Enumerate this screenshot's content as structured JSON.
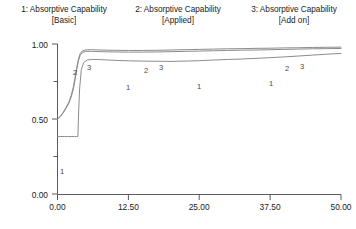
{
  "legend": {
    "entries": [
      {
        "title": "1: Absorptive Capability",
        "subtitle": "[Basic]"
      },
      {
        "title": "2: Absorptive Capability",
        "subtitle": "[Applied]"
      },
      {
        "title": "3: Absorptive Capability",
        "subtitle": "[Add on]"
      }
    ]
  },
  "axes": {
    "y_labels": [
      "1.00",
      "0.50",
      "0.00"
    ],
    "x_labels": [
      "0.00",
      "12.50",
      "25.00",
      "37.50",
      "50.00"
    ]
  },
  "curve_tags": {
    "tag_1a": "1",
    "tag_1b": "1",
    "tag_1c": "1",
    "tag_1d": "1",
    "tag_2a": "2",
    "tag_2b": "2",
    "tag_2c": "2",
    "tag_3a": "3",
    "tag_3b": "3",
    "tag_3c": "3"
  },
  "chart_data": {
    "type": "line",
    "title": "",
    "subtitle": "",
    "xlabel": "",
    "ylabel": "",
    "xlim": [
      0.0,
      50.0
    ],
    "ylim": [
      0.0,
      1.0
    ],
    "xticks": [
      0.0,
      12.5,
      25.0,
      37.5,
      50.0
    ],
    "xtick_labels": [
      "0.00",
      "12.50",
      "25.00",
      "37.50",
      "50.00"
    ],
    "yticks": [
      0.0,
      0.25,
      0.5,
      0.75,
      1.0
    ],
    "ytick_labels": [
      "0.00",
      "",
      "0.50",
      "",
      "1.00"
    ],
    "ytick_labeled": [
      0.0,
      0.5,
      1.0
    ],
    "grid": false,
    "legend_position": "top",
    "line_color": "#8c8c8c",
    "axis_color": "#5a5a5a",
    "series": [
      {
        "name": "1: Absorptive Capability [Basic]",
        "label": "1",
        "x": [
          0.0,
          0.6,
          1.2,
          1.8,
          2.4,
          3.0,
          3.4,
          3.6,
          3.7,
          3.9,
          4.2,
          4.6,
          5.2,
          6.0,
          7.0,
          8.5,
          10.0,
          12.5,
          15.0,
          17.5,
          20.0,
          22.5,
          25.0,
          27.5,
          30.0,
          32.5,
          35.0,
          37.5,
          40.0,
          42.5,
          45.0,
          47.5,
          50.0
        ],
        "y": [
          0.383,
          0.383,
          0.383,
          0.383,
          0.383,
          0.383,
          0.383,
          0.383,
          0.52,
          0.7,
          0.83,
          0.875,
          0.893,
          0.897,
          0.897,
          0.894,
          0.891,
          0.888,
          0.886,
          0.885,
          0.884,
          0.886,
          0.889,
          0.893,
          0.897,
          0.9,
          0.904,
          0.909,
          0.914,
          0.92,
          0.926,
          0.932,
          0.937
        ]
      },
      {
        "name": "2: Absorptive Capability [Applied]",
        "label": "2",
        "x": [
          0.0,
          0.5,
          1.0,
          1.5,
          2.0,
          2.4,
          2.8,
          3.1,
          3.4,
          3.7,
          4.0,
          4.4,
          5.0,
          6.0,
          7.5,
          10.0,
          12.5,
          15.0,
          17.5,
          20.0,
          22.5,
          25.0,
          27.5,
          30.0,
          32.5,
          35.0,
          37.5,
          40.0,
          42.5,
          45.0,
          47.5,
          50.0
        ],
        "y": [
          0.5,
          0.516,
          0.54,
          0.57,
          0.605,
          0.645,
          0.7,
          0.762,
          0.83,
          0.888,
          0.925,
          0.944,
          0.951,
          0.951,
          0.949,
          0.947,
          0.946,
          0.946,
          0.947,
          0.949,
          0.951,
          0.953,
          0.955,
          0.957,
          0.959,
          0.96,
          0.962,
          0.964,
          0.966,
          0.968,
          0.969,
          0.97
        ]
      },
      {
        "name": "3: Absorptive Capability [Add on]",
        "label": "3",
        "x": [
          0.0,
          0.5,
          1.0,
          1.5,
          2.0,
          2.4,
          2.8,
          3.1,
          3.4,
          3.7,
          4.0,
          4.4,
          5.0,
          6.0,
          7.5,
          10.0,
          12.5,
          15.0,
          17.5,
          20.0,
          22.5,
          25.0,
          27.5,
          30.0,
          32.5,
          35.0,
          37.5,
          40.0,
          42.5,
          45.0,
          47.5,
          50.0
        ],
        "y": [
          0.5,
          0.518,
          0.544,
          0.576,
          0.613,
          0.656,
          0.714,
          0.778,
          0.846,
          0.901,
          0.936,
          0.954,
          0.961,
          0.962,
          0.96,
          0.958,
          0.957,
          0.957,
          0.958,
          0.96,
          0.962,
          0.964,
          0.966,
          0.968,
          0.969,
          0.971,
          0.972,
          0.974,
          0.975,
          0.977,
          0.978,
          0.979
        ]
      }
    ]
  }
}
